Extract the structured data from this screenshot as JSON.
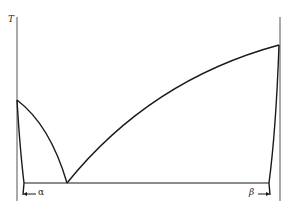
{
  "diagram": {
    "type": "binary eutectic phase diagram",
    "y_axis_label": "T",
    "phase_labels": {
      "alpha": "α",
      "beta": "β"
    },
    "colors": {
      "line": "#1a1a1a",
      "axis": "#555555",
      "background": "#ffffff"
    }
  }
}
